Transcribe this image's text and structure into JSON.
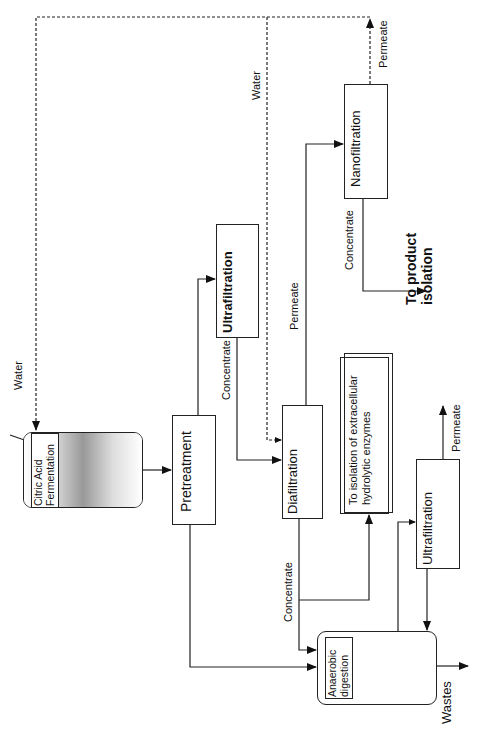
{
  "diagram": {
    "orientation": "rotated 90deg counter-clockwise",
    "units": {
      "fermentation": [
        "Citric Acid",
        "Fermentation"
      ],
      "pretreatment": "Pretreatment",
      "ultrafiltration_1": "Ultrafiltration",
      "diafiltration": "Diafiltration",
      "nanofiltration": "Nanofiltration",
      "ultrafiltration_2": "Ultrafiltration",
      "anaerobic": [
        "Anaerobic",
        "digestion"
      ],
      "enzymes": [
        "To isolation of extracellular",
        "hydrolytic enzymes"
      ]
    },
    "labels": {
      "water_1": "Water",
      "water_2": "Water",
      "concentrate_uf1": "Concentrate",
      "permeate_dia": "Permeate",
      "permeate_nf": "Permeate",
      "concentrate_nf": "Concentrate",
      "product": [
        "To product",
        "isolation"
      ],
      "permeate_uf2": "Permeate",
      "concentrate_dia": "Concentrate",
      "wastes": "Wastes"
    },
    "edges": [
      {
        "from": "Citric Acid Fermentation",
        "to": "Pretreatment"
      },
      {
        "from": "Pretreatment",
        "to": "Ultrafiltration"
      },
      {
        "from": "Pretreatment",
        "to": "Anaerobic digestion"
      },
      {
        "from": "Ultrafiltration",
        "to": "Diafiltration",
        "label": "Concentrate"
      },
      {
        "from": "Water",
        "to": "Diafiltration",
        "style": "dashed"
      },
      {
        "from": "Diafiltration",
        "to": "Nanofiltration",
        "label": "Permeate"
      },
      {
        "from": "Diafiltration",
        "to": "To isolation of extracellular hydrolytic enzymes",
        "label": "Concentrate"
      },
      {
        "from": "Diafiltration",
        "to": "Anaerobic digestion",
        "label": "Concentrate"
      },
      {
        "from": "Nanofiltration",
        "to": "To product isolation",
        "label": "Concentrate"
      },
      {
        "from": "Nanofiltration",
        "to": "Water (recycle to fermentation)",
        "label": "Permeate",
        "style": "dashed"
      },
      {
        "from": "Anaerobic digestion",
        "to": "Ultrafiltration (2)"
      },
      {
        "from": "Ultrafiltration (2)",
        "to": "Anaerobic digestion"
      },
      {
        "from": "Ultrafiltration (2)",
        "to": "Permeate out",
        "label": "Permeate"
      },
      {
        "from": "Anaerobic digestion",
        "to": "Wastes"
      }
    ]
  }
}
